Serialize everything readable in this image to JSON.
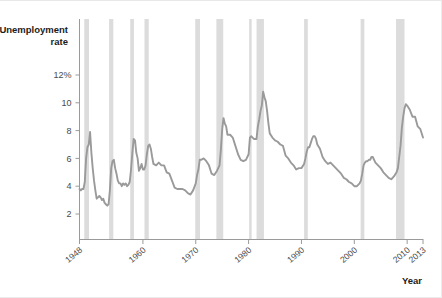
{
  "chart_data": {
    "type": "line",
    "title": "",
    "ylabel": "Unemployment rate",
    "xlabel": "Year",
    "ylim": [
      0,
      12
    ],
    "xlim": [
      1948,
      2013
    ],
    "grid": false,
    "legend": null,
    "y_ticks": [
      {
        "value": 12,
        "label": "12%"
      },
      {
        "value": 10,
        "label": "10"
      },
      {
        "value": 8,
        "label": "8"
      },
      {
        "value": 6,
        "label": "6"
      },
      {
        "value": 4,
        "label": "4"
      },
      {
        "value": 2,
        "label": "2"
      }
    ],
    "x_ticks": [
      {
        "value": 1948,
        "label": "1948"
      },
      {
        "value": 1960,
        "label": "1960"
      },
      {
        "value": 1970,
        "label": "1970"
      },
      {
        "value": 1980,
        "label": "1980"
      },
      {
        "value": 1990,
        "label": "1990"
      },
      {
        "value": 2000,
        "label": "2000"
      },
      {
        "value": 2010,
        "label": "2010"
      },
      {
        "value": 2013,
        "label": "2013"
      }
    ],
    "series": [
      {
        "name": "Unemployment rate",
        "color": "#9a9a9a",
        "x": [
          1948.0,
          1948.25,
          1948.5,
          1948.75,
          1949.0,
          1949.25,
          1949.5,
          1949.75,
          1950.0,
          1950.25,
          1950.5,
          1950.75,
          1951.0,
          1951.25,
          1951.5,
          1951.75,
          1952.0,
          1952.25,
          1952.5,
          1952.75,
          1953.0,
          1953.25,
          1953.5,
          1953.75,
          1954.0,
          1954.25,
          1954.5,
          1954.75,
          1955.0,
          1955.25,
          1955.5,
          1955.75,
          1956.0,
          1956.25,
          1956.5,
          1956.75,
          1957.0,
          1957.25,
          1957.5,
          1957.75,
          1958.0,
          1958.25,
          1958.5,
          1958.75,
          1959.0,
          1959.25,
          1959.5,
          1959.75,
          1960.0,
          1960.25,
          1960.5,
          1960.75,
          1961.0,
          1961.25,
          1961.5,
          1961.75,
          1962.0,
          1962.5,
          1963.0,
          1963.5,
          1964.0,
          1964.5,
          1965.0,
          1965.5,
          1966.0,
          1966.5,
          1967.0,
          1967.5,
          1968.0,
          1968.5,
          1969.0,
          1969.5,
          1970.0,
          1970.25,
          1970.5,
          1970.75,
          1971.0,
          1971.5,
          1972.0,
          1972.5,
          1973.0,
          1973.5,
          1974.0,
          1974.5,
          1974.75,
          1975.0,
          1975.25,
          1975.5,
          1975.75,
          1976.0,
          1976.5,
          1977.0,
          1977.5,
          1978.0,
          1978.5,
          1979.0,
          1979.5,
          1980.0,
          1980.25,
          1980.5,
          1980.75,
          1981.0,
          1981.25,
          1981.5,
          1981.75,
          1982.0,
          1982.25,
          1982.5,
          1982.75,
          1983.0,
          1983.25,
          1983.5,
          1983.75,
          1984.0,
          1984.5,
          1985.0,
          1985.5,
          1986.0,
          1986.5,
          1987.0,
          1987.5,
          1988.0,
          1988.5,
          1989.0,
          1989.5,
          1990.0,
          1990.5,
          1990.75,
          1991.0,
          1991.25,
          1991.5,
          1991.75,
          1992.0,
          1992.25,
          1992.5,
          1992.75,
          1993.0,
          1993.5,
          1994.0,
          1994.5,
          1995.0,
          1995.5,
          1996.0,
          1996.5,
          1997.0,
          1997.5,
          1998.0,
          1998.5,
          1999.0,
          1999.5,
          2000.0,
          2000.5,
          2001.0,
          2001.25,
          2001.5,
          2001.75,
          2002.0,
          2002.25,
          2002.5,
          2002.75,
          2003.0,
          2003.25,
          2003.5,
          2003.75,
          2004.0,
          2004.5,
          2005.0,
          2005.5,
          2006.0,
          2006.5,
          2007.0,
          2007.5,
          2008.0,
          2008.25,
          2008.5,
          2008.75,
          2009.0,
          2009.25,
          2009.5,
          2009.75,
          2010.0,
          2010.5,
          2011.0,
          2011.5,
          2012.0,
          2012.5,
          2013.0
        ],
        "y": [
          3.8,
          3.7,
          3.8,
          3.8,
          4.3,
          6.0,
          6.8,
          7.0,
          7.9,
          6.4,
          5.3,
          4.4,
          3.7,
          3.1,
          3.2,
          3.3,
          3.2,
          3.0,
          3.1,
          2.8,
          2.7,
          2.6,
          2.7,
          3.7,
          5.3,
          5.8,
          5.9,
          5.3,
          4.9,
          4.4,
          4.2,
          4.2,
          4.0,
          4.2,
          4.1,
          4.2,
          4.0,
          4.1,
          4.3,
          5.2,
          6.4,
          7.4,
          7.3,
          6.4,
          6.0,
          5.1,
          5.3,
          5.6,
          5.2,
          5.2,
          5.5,
          6.3,
          6.9,
          7.0,
          6.7,
          6.1,
          5.6,
          5.5,
          5.7,
          5.5,
          5.5,
          5.0,
          4.9,
          4.4,
          3.9,
          3.8,
          3.8,
          3.8,
          3.7,
          3.5,
          3.4,
          3.7,
          4.2,
          4.8,
          5.2,
          5.9,
          5.9,
          6.0,
          5.8,
          5.5,
          4.9,
          4.8,
          5.1,
          5.5,
          6.6,
          8.1,
          8.9,
          8.5,
          8.3,
          7.7,
          7.7,
          7.5,
          6.9,
          6.3,
          5.9,
          5.8,
          5.9,
          6.3,
          7.5,
          7.6,
          7.5,
          7.4,
          7.4,
          7.4,
          8.3,
          8.8,
          9.4,
          9.8,
          10.8,
          10.4,
          10.1,
          9.4,
          8.5,
          7.8,
          7.5,
          7.3,
          7.2,
          7.0,
          6.9,
          6.2,
          6.0,
          5.7,
          5.5,
          5.2,
          5.3,
          5.3,
          5.6,
          6.0,
          6.5,
          6.8,
          6.8,
          7.1,
          7.4,
          7.6,
          7.6,
          7.4,
          7.0,
          6.7,
          6.1,
          5.8,
          5.6,
          5.7,
          5.5,
          5.3,
          5.1,
          4.9,
          4.6,
          4.5,
          4.3,
          4.2,
          4.0,
          4.0,
          4.2,
          4.4,
          4.9,
          5.5,
          5.7,
          5.8,
          5.8,
          5.9,
          5.9,
          6.1,
          6.1,
          5.9,
          5.7,
          5.5,
          5.3,
          5.0,
          4.8,
          4.6,
          4.5,
          4.7,
          5.0,
          5.3,
          6.1,
          6.9,
          8.2,
          9.0,
          9.6,
          9.9,
          9.8,
          9.5,
          9.0,
          9.0,
          8.3,
          8.1,
          7.5
        ]
      }
    ],
    "recession_bands": [
      {
        "start": 1948.9,
        "end": 1949.8
      },
      {
        "start": 1953.6,
        "end": 1954.4
      },
      {
        "start": 1957.6,
        "end": 1958.3
      },
      {
        "start": 1960.3,
        "end": 1961.1
      },
      {
        "start": 1969.9,
        "end": 1970.8
      },
      {
        "start": 1973.9,
        "end": 1975.2
      },
      {
        "start": 1980.1,
        "end": 1980.5
      },
      {
        "start": 1981.5,
        "end": 1982.9
      },
      {
        "start": 1990.5,
        "end": 1991.2
      },
      {
        "start": 2001.2,
        "end": 2001.9
      },
      {
        "start": 2007.9,
        "end": 2009.5
      }
    ],
    "recession_band_color": "#dcdcdc",
    "axis_color": "#909090"
  }
}
